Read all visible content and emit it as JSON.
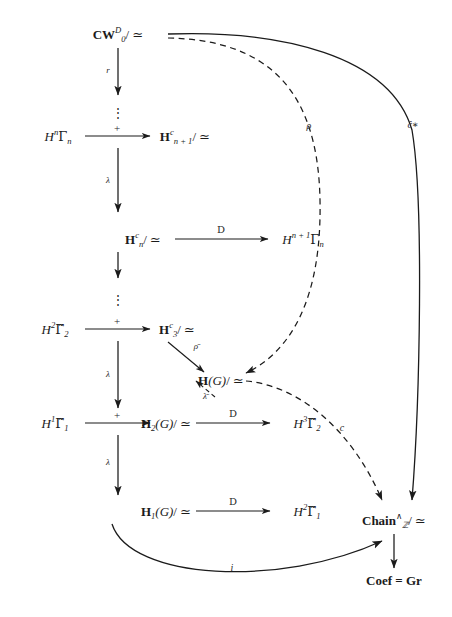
{
  "figure": {
    "type": "commutative-diagram",
    "background": "#ffffff",
    "ink": "#1b1b1b",
    "nodes": {
      "cw": "CW",
      "cw_sup": "D",
      "cw_sub": "0",
      "cw_tail": "/ ≃",
      "hn1": "H",
      "hn1_sup": "c",
      "hn1_sub": "n + 1",
      "hn1_tail": "/ ≃",
      "hn": "H",
      "hn_sup": "c",
      "hn_sub": "n",
      "hn_tail": "/ ≃",
      "h3": "H",
      "h3_sup": "c",
      "h3_sub": "3",
      "h3_tail": "/ ≃",
      "hg": "H",
      "hg_arg": "(G)",
      "hg_tail": "/ ≃",
      "h2g": "H",
      "h2g_sub": "2",
      "h2g_arg": "(G)",
      "h2g_tail": "/ ≃",
      "h1g": "H",
      "h1g_sub": "1",
      "h1g_arg": "(G)",
      "h1g_tail": "/ ≃",
      "chain": "Chain",
      "chain_sup": "∧",
      "chain_sub": "ℤ",
      "chain_tail": "/ ≃",
      "coef": "Coef = Gr",
      "src_hn": "H",
      "src_hn_sup": "n",
      "src_hn_g": "Γ",
      "src_hn_sub": "n",
      "src_h2": "H",
      "src_h2_sup": "2",
      "src_h2_g": "Γ̃",
      "src_h2_sub": "2",
      "src_h1": "H",
      "src_h1_sup": "1",
      "src_h1_g": "Γ̃",
      "src_h1_sub": "1",
      "tgt_hn1": "H",
      "tgt_hn1_sup": "n + 1",
      "tgt_hn1_g": "Γ",
      "tgt_hn1_sub": "n",
      "tgt_h3": "H",
      "tgt_h3_sup": "3",
      "tgt_h3_g": "Γ̃",
      "tgt_h3_sub": "2",
      "tgt_h2": "H",
      "tgt_h2_sup": "2",
      "tgt_h2_g": "Γ̃",
      "tgt_h2_sub": "1"
    },
    "arrow_labels": {
      "r": "r",
      "lambda1": "λ",
      "lambda2": "λ",
      "lambda3": "λ",
      "plus1": "+",
      "plus2": "+",
      "plus3": "+",
      "frakD1": "D",
      "frakD2": "D",
      "frakD3": "D",
      "rho_bar": "ρ̄",
      "lambda_bar": "λ̄",
      "rho": "ρ",
      "c_hat": "ĉ∗",
      "c": "c",
      "i": "i"
    },
    "dots": {
      "d1": "⋮",
      "d2": "⋮",
      "d3": "⋮"
    }
  }
}
